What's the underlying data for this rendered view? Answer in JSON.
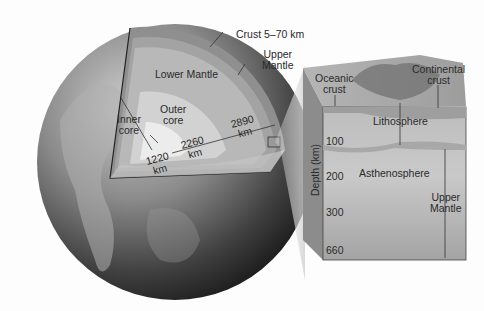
{
  "diagram": {
    "globe": {
      "labels": {
        "crust": "Crust 5–70 km",
        "upper_mantle": "Upper Mantle",
        "lower_mantle": "Lower Mantle",
        "outer_core_1": "Outer",
        "outer_core_2": "core",
        "inner_core_1": "Inner",
        "inner_core_2": "core",
        "upper_mantle_1": "Upper",
        "upper_mantle_2": "Mantle"
      },
      "measurements": [
        {
          "value": "1220",
          "unit": "km"
        },
        {
          "value": "2260",
          "unit": "km"
        },
        {
          "value": "2890",
          "unit": "km"
        }
      ]
    },
    "block": {
      "labels": {
        "oceanic_1": "Oceanic",
        "oceanic_2": "crust",
        "continental_1": "Continental",
        "continental_2": "crust",
        "lithosphere": "Lithosphere",
        "asthenosphere": "Asthenosphere",
        "upper_mantle_1": "Upper",
        "upper_mantle_2": "Mantle"
      },
      "axis_label": "Depth (km)",
      "depth_ticks": [
        "100",
        "200",
        "300",
        "660"
      ]
    },
    "colors": {
      "crust": "#8f8f8f",
      "upper_mantle": "#a3a3a3",
      "lower_mantle": "#b8b8b8",
      "outer_core": "#d2d2d2",
      "inner_core": "#ececec",
      "globe_dark": "#3a3a3a"
    }
  }
}
